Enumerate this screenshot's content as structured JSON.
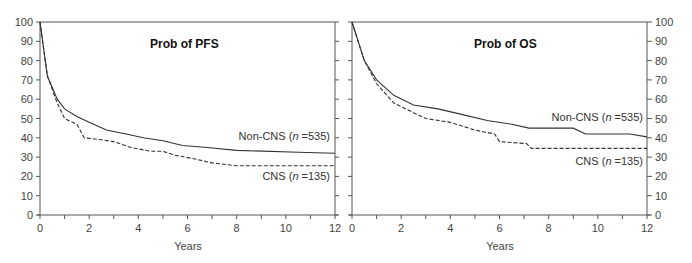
{
  "chart_data": [
    {
      "type": "line",
      "title": "Prob of PFS",
      "xlabel": "Years",
      "ylabel": "",
      "xlim": [
        0,
        12
      ],
      "ylim": [
        0,
        100
      ],
      "x_ticks": [
        0,
        2,
        4,
        6,
        8,
        10,
        12
      ],
      "y_ticks": [
        0,
        10,
        20,
        30,
        40,
        50,
        60,
        70,
        80,
        90,
        100
      ],
      "grid": false,
      "legend_position": "inline right",
      "step": true,
      "series": [
        {
          "name": "Non-CNS",
          "label": "Non-CNS (n=535)",
          "style": "solid",
          "x": [
            0,
            0.3,
            0.7,
            1.0,
            1.5,
            2.0,
            2.7,
            3.5,
            4.2,
            5.0,
            5.8,
            6.8,
            8.0,
            10.5,
            12.0
          ],
          "y": [
            100,
            72,
            60,
            55,
            51,
            48,
            44,
            42,
            40,
            38.5,
            36,
            35,
            33.5,
            32.5,
            32
          ]
        },
        {
          "name": "CNS",
          "label": "CNS (n=135)",
          "style": "dashed",
          "x": [
            0,
            0.3,
            0.7,
            1.0,
            1.5,
            1.8,
            2.5,
            3.0,
            3.7,
            4.5,
            5.0,
            5.5,
            6.3,
            7.0,
            8.0,
            12.0
          ],
          "y": [
            100,
            72,
            58,
            50,
            47,
            40,
            39,
            38,
            35,
            33,
            33,
            31,
            29,
            27,
            25.5,
            25.5
          ]
        }
      ]
    },
    {
      "type": "line",
      "title": "Prob of OS",
      "xlabel": "Years",
      "ylabel": "",
      "xlim": [
        0,
        12
      ],
      "ylim": [
        0,
        100
      ],
      "x_ticks": [
        0,
        2,
        4,
        6,
        8,
        10,
        12
      ],
      "y_ticks": [
        0,
        10,
        20,
        30,
        40,
        50,
        60,
        70,
        80,
        90,
        100
      ],
      "y_axis_side": "right",
      "grid": false,
      "legend_position": "inline right",
      "step": true,
      "series": [
        {
          "name": "Non-CNS",
          "label": "Non-CNS (n=535)",
          "style": "solid",
          "x": [
            0,
            0.5,
            1.0,
            1.7,
            2.5,
            3.5,
            4.5,
            5.5,
            6.5,
            7.2,
            9.0,
            9.5,
            11.3,
            12.0
          ],
          "y": [
            100,
            80,
            70,
            62,
            57,
            55,
            52,
            49,
            47,
            45,
            45,
            42,
            42,
            40.5
          ]
        },
        {
          "name": "CNS",
          "label": "CNS (n=135)",
          "style": "dashed",
          "x": [
            0,
            0.5,
            1.0,
            1.7,
            2.5,
            3.0,
            4.0,
            5.0,
            5.8,
            6.0,
            7.1,
            7.3,
            12.0
          ],
          "y": [
            100,
            80,
            68,
            58,
            53,
            50,
            48,
            44,
            42,
            38,
            37,
            34.5,
            34.5
          ]
        }
      ]
    }
  ],
  "panels": [
    {
      "title": "Prob of PFS",
      "xlabel": "Years",
      "labels": {
        "noncns": "Non-CNS (",
        "noncns_n": "n",
        "noncns_rest": " =535)",
        "cns": "CNS (",
        "cns_n": "n",
        "cns_rest": " =135)"
      }
    },
    {
      "title": "Prob of OS",
      "xlabel": "Years",
      "labels": {
        "noncns": "Non-CNS (",
        "noncns_n": "n",
        "noncns_rest": " =535)",
        "cns": "CNS (",
        "cns_n": "n",
        "cns_rest": " =135)"
      }
    }
  ],
  "colors": {
    "axis": "#555555",
    "line": "#333333",
    "text": "#333333"
  }
}
